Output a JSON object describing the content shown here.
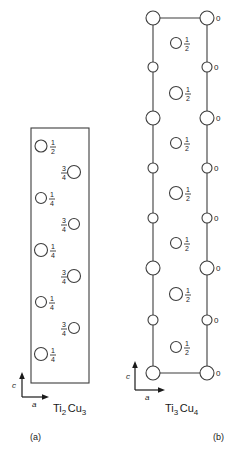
{
  "figure": {
    "background_color": "#ffffff",
    "line_color": "#3d3d3d",
    "text_color": "#1a1a1a",
    "panels": [
      {
        "id": "a",
        "panel_label": "(a)",
        "formula": {
          "full": "Ti2Cu3",
          "parts": [
            {
              "text": "Ti",
              "sub": false
            },
            {
              "text": "2",
              "sub": true
            },
            {
              "text": "Cu",
              "sub": false
            },
            {
              "text": "3",
              "sub": true
            }
          ]
        },
        "axes": {
          "vertical_label": "c",
          "horizontal_label": "a"
        },
        "cell": {
          "x": 31,
          "y": 128,
          "width": 58,
          "height": 255
        },
        "atoms": [
          {
            "cx": 41,
            "cy": 146,
            "r": 6.0,
            "height": "1/2",
            "num": "1",
            "den": "2",
            "label_side": "right"
          },
          {
            "cx": 74,
            "cy": 172,
            "r": 6.5,
            "height": "3/4",
            "num": "3",
            "den": "4",
            "label_side": "left"
          },
          {
            "cx": 41,
            "cy": 198,
            "r": 5.5,
            "height": "1/4",
            "num": "1",
            "den": "4",
            "label_side": "right"
          },
          {
            "cx": 74,
            "cy": 224,
            "r": 5.5,
            "height": "3/4",
            "num": "3",
            "den": "4",
            "label_side": "left"
          },
          {
            "cx": 41,
            "cy": 250,
            "r": 6.5,
            "height": "1/4",
            "num": "1",
            "den": "4",
            "label_side": "right"
          },
          {
            "cx": 74,
            "cy": 276,
            "r": 6.5,
            "height": "3/4",
            "num": "3",
            "den": "4",
            "label_side": "left"
          },
          {
            "cx": 41,
            "cy": 302,
            "r": 5.5,
            "height": "1/4",
            "num": "1",
            "den": "4",
            "label_side": "right"
          },
          {
            "cx": 74,
            "cy": 328,
            "r": 5.5,
            "height": "3/4",
            "num": "3",
            "den": "4",
            "label_side": "left"
          },
          {
            "cx": 41,
            "cy": 354,
            "r": 6.5,
            "height": "1/4",
            "num": "1",
            "den": "4",
            "label_side": "right"
          }
        ]
      },
      {
        "id": "b",
        "panel_label": "(b)",
        "formula": {
          "full": "Ti3Cu4",
          "parts": [
            {
              "text": "Ti",
              "sub": false
            },
            {
              "text": "3",
              "sub": true
            },
            {
              "text": "Cu",
              "sub": false
            },
            {
              "text": "4",
              "sub": true
            }
          ]
        },
        "axes": {
          "vertical_label": "c",
          "horizontal_label": "a"
        },
        "cell": {
          "left_x": 153,
          "right_x": 207,
          "top_y": 18,
          "bottom_y": 373
        },
        "left_column_atoms": [
          {
            "cx": 153,
            "cy": 18,
            "r": 7.0,
            "size": "large"
          },
          {
            "cx": 153,
            "cy": 67,
            "r": 5.0,
            "size": "small"
          },
          {
            "cx": 153,
            "cy": 118,
            "r": 7.0,
            "size": "large"
          },
          {
            "cx": 153,
            "cy": 168,
            "r": 5.0,
            "size": "small"
          },
          {
            "cx": 153,
            "cy": 218,
            "r": 5.0,
            "size": "small"
          },
          {
            "cx": 153,
            "cy": 268,
            "r": 7.0,
            "size": "large"
          },
          {
            "cx": 153,
            "cy": 320,
            "r": 5.0,
            "size": "small"
          },
          {
            "cx": 153,
            "cy": 373,
            "r": 7.0,
            "size": "large"
          }
        ],
        "right_column_atoms": [
          {
            "cx": 207,
            "cy": 18,
            "r": 7.0,
            "size": "large",
            "height": "0"
          },
          {
            "cx": 207,
            "cy": 67,
            "r": 5.0,
            "size": "small",
            "height": "0"
          },
          {
            "cx": 207,
            "cy": 118,
            "r": 7.0,
            "size": "large",
            "height": "0"
          },
          {
            "cx": 207,
            "cy": 168,
            "r": 5.0,
            "size": "small",
            "height": "0"
          },
          {
            "cx": 207,
            "cy": 218,
            "r": 5.0,
            "size": "small",
            "height": "0"
          },
          {
            "cx": 207,
            "cy": 268,
            "r": 7.0,
            "size": "large",
            "height": "0"
          },
          {
            "cx": 207,
            "cy": 320,
            "r": 5.0,
            "size": "small",
            "height": "0"
          },
          {
            "cx": 207,
            "cy": 373,
            "r": 7.0,
            "size": "large",
            "height": "0"
          }
        ],
        "center_atoms": [
          {
            "cx": 176,
            "cy": 43,
            "r": 5.5,
            "height": "1/2",
            "num": "1",
            "den": "2"
          },
          {
            "cx": 176,
            "cy": 93,
            "r": 6.5,
            "height": "1/2",
            "num": "1",
            "den": "2"
          },
          {
            "cx": 176,
            "cy": 143,
            "r": 5.5,
            "height": "1/2",
            "num": "1",
            "den": "2"
          },
          {
            "cx": 176,
            "cy": 193,
            "r": 6.5,
            "height": "1/2",
            "num": "1",
            "den": "2"
          },
          {
            "cx": 176,
            "cy": 243,
            "r": 5.5,
            "height": "1/2",
            "num": "1",
            "den": "2"
          },
          {
            "cx": 176,
            "cy": 294,
            "r": 6.5,
            "height": "1/2",
            "num": "1",
            "den": "2"
          },
          {
            "cx": 176,
            "cy": 347,
            "r": 5.5,
            "height": "1/2",
            "num": "1",
            "den": "2"
          }
        ]
      }
    ]
  }
}
